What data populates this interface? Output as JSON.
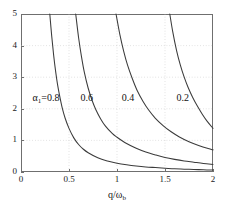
{
  "chart_data": {
    "type": "line",
    "title": "",
    "subtitle": "",
    "xlabel": "q/ωb",
    "xlabel_parts": {
      "numerator": "q",
      "slash": "/",
      "denominator": "ω",
      "denominator_sub": "b"
    },
    "ylabel": "",
    "xlim": [
      0,
      2
    ],
    "ylim": [
      0,
      5
    ],
    "xticks": [
      0,
      0.5,
      1,
      1.5,
      2
    ],
    "xticklabels": [
      "0",
      "0.5",
      "1",
      "1.5",
      "2"
    ],
    "yticks": [
      0,
      1,
      2,
      3,
      4,
      5
    ],
    "yticklabels": [
      "0",
      "1",
      "2",
      "3",
      "4",
      "5"
    ],
    "grid": true,
    "grid_style": "dotted",
    "legend_position": "inline-annotations",
    "line_color": "#3b3b3b",
    "grid_color": "#bdbdbd",
    "axis_color": "#6f6f6f",
    "background_color": "#ffffff",
    "annotations": [
      {
        "text": "α1=0.8",
        "text_main": "α",
        "text_sub": "1",
        "text_tail": "=0.8",
        "x": 0.12,
        "y": 2.35
      },
      {
        "text": "0.6",
        "x": 0.62,
        "y": 2.35
      },
      {
        "text": "0.4",
        "x": 1.05,
        "y": 2.35
      },
      {
        "text": "0.2",
        "x": 1.62,
        "y": 2.35
      }
    ],
    "series": [
      {
        "name": "α1=0.8",
        "alpha1": 0.8,
        "x": [
          0.3,
          0.32,
          0.34,
          0.36,
          0.38,
          0.4,
          0.43,
          0.46,
          0.5,
          0.55,
          0.6,
          0.65,
          0.7,
          0.8,
          0.9,
          1.0,
          1.1,
          1.2,
          1.3,
          1.4,
          1.5,
          1.6,
          1.7,
          1.8,
          1.9,
          2.0
        ],
        "y": [
          5.0,
          4.3,
          3.7,
          3.2,
          2.78,
          2.45,
          2.02,
          1.7,
          1.38,
          1.08,
          0.87,
          0.72,
          0.61,
          0.45,
          0.35,
          0.28,
          0.23,
          0.19,
          0.16,
          0.14,
          0.12,
          0.1,
          0.09,
          0.08,
          0.07,
          0.06
        ]
      },
      {
        "name": "0.6",
        "alpha1": 0.6,
        "x": [
          0.57,
          0.6,
          0.63,
          0.66,
          0.7,
          0.74,
          0.78,
          0.83,
          0.88,
          0.95,
          1.0,
          1.1,
          1.2,
          1.3,
          1.4,
          1.5,
          1.6,
          1.7,
          1.8,
          1.9,
          2.0
        ],
        "y": [
          5.0,
          4.25,
          3.65,
          3.15,
          2.65,
          2.27,
          1.97,
          1.68,
          1.45,
          1.22,
          1.1,
          0.9,
          0.75,
          0.63,
          0.54,
          0.46,
          0.4,
          0.35,
          0.31,
          0.27,
          0.24
        ]
      },
      {
        "name": "0.4",
        "alpha1": 0.4,
        "x": [
          0.99,
          1.03,
          1.07,
          1.11,
          1.16,
          1.21,
          1.27,
          1.33,
          1.4,
          1.48,
          1.56,
          1.65,
          1.75,
          1.85,
          1.95,
          2.0
        ],
        "y": [
          5.0,
          4.35,
          3.82,
          3.38,
          2.95,
          2.58,
          2.24,
          1.96,
          1.7,
          1.47,
          1.28,
          1.11,
          0.96,
          0.84,
          0.74,
          0.7
        ]
      },
      {
        "name": "0.2",
        "alpha1": 0.2,
        "x": [
          1.55,
          1.58,
          1.62,
          1.66,
          1.7,
          1.74,
          1.79,
          1.84,
          1.89,
          1.94,
          2.0
        ],
        "y": [
          5.0,
          4.45,
          3.85,
          3.38,
          3.0,
          2.68,
          2.35,
          2.07,
          1.82,
          1.6,
          1.38
        ]
      }
    ]
  }
}
